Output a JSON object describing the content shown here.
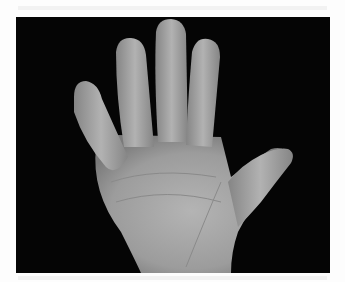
{
  "image": {
    "subject": "open palm of a hand, five fingers spread",
    "background_color": "#050505",
    "page_color": "#fdfdfd",
    "skin_tone": "#a9a9a9"
  }
}
